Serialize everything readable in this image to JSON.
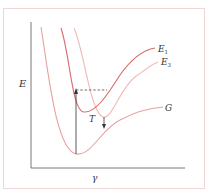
{
  "figure": {
    "type": "potential-energy-diagram",
    "axes": {
      "y_label": "E",
      "x_label": "γ"
    },
    "curves": [
      {
        "id": "G",
        "label": "G",
        "color": "#e8a0a0"
      },
      {
        "id": "E1",
        "label": "E",
        "subscript": "1",
        "color": "#d86a6a"
      },
      {
        "id": "E3",
        "label": "E",
        "subscript": "3",
        "color": "#f0b8b8"
      }
    ],
    "annotations": {
      "transition_label": "T"
    },
    "colors": {
      "frame": "#f2d6d6",
      "axis": "#555555",
      "arrow": "#333333"
    }
  }
}
